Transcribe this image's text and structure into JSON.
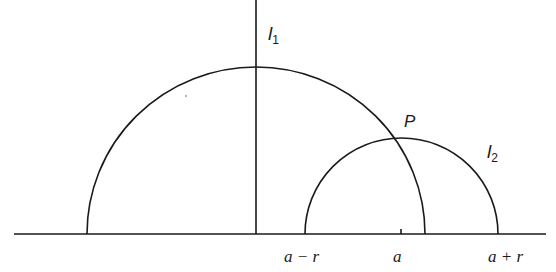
{
  "diagram": {
    "lines": {
      "l1": {
        "label_main": "l",
        "label_sub": "1",
        "center_x_px": 256,
        "radius_px": 169
      },
      "l2": {
        "label_main": "l",
        "label_sub": "2",
        "center_x_px": 401.5,
        "radius_px": 96.5
      }
    },
    "point": {
      "label": "P"
    },
    "axis_labels": {
      "left": "a − r",
      "center": "a",
      "right": "a + r"
    },
    "colors": {
      "stroke": "#1a1a1a",
      "background": "#ffffff"
    }
  }
}
